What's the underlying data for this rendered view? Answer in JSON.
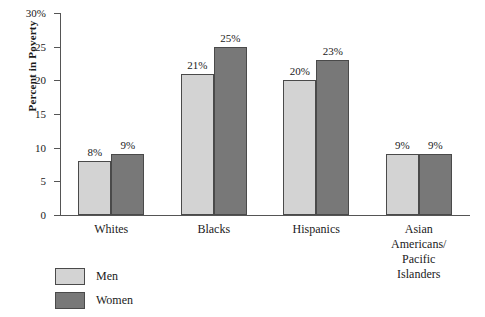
{
  "chart_data": {
    "type": "bar",
    "title": "",
    "xlabel": "",
    "ylabel": "Percent in Poverty",
    "ylim": [
      0,
      30
    ],
    "grid": false,
    "legend_position": "bottom-left",
    "categories": [
      "Whites",
      "Blacks",
      "Hispanics",
      "Asian Americans/\nPacific Islanders"
    ],
    "series": [
      {
        "name": "Men",
        "color": "#d3d3d3",
        "values": [
          8,
          21,
          20,
          9
        ]
      },
      {
        "name": "Women",
        "color": "#787878",
        "values": [
          9,
          25,
          23,
          9
        ]
      }
    ],
    "value_labels": [
      [
        "8%",
        "9%"
      ],
      [
        "21%",
        "25%"
      ],
      [
        "20%",
        "23%"
      ],
      [
        "9%",
        "9%"
      ]
    ],
    "y_ticks": [
      {
        "value": 0,
        "label": "0"
      },
      {
        "value": 5,
        "label": "5"
      },
      {
        "value": 10,
        "label": "10"
      },
      {
        "value": 15,
        "label": "15"
      },
      {
        "value": 20,
        "label": "20"
      },
      {
        "value": 25,
        "label": "25"
      },
      {
        "value": 30,
        "label": "30%"
      }
    ]
  },
  "legend": {
    "items": [
      {
        "label": "Men"
      },
      {
        "label": "Women"
      }
    ]
  },
  "axis": {
    "y_title": "Percent in Poverty"
  }
}
